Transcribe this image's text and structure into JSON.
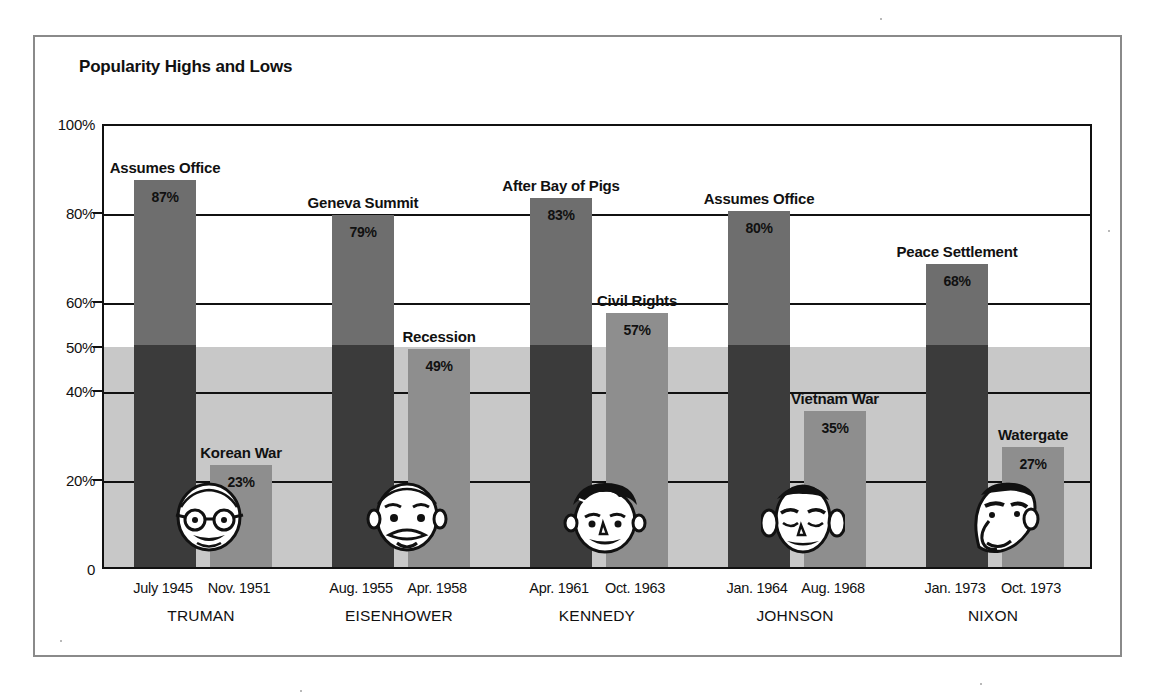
{
  "chart_data": {
    "type": "bar",
    "title": "Popularity Highs and Lows",
    "xlabel": "",
    "ylabel": "",
    "ylim": [
      0,
      100
    ],
    "yticks": [
      "0",
      "20%",
      "40%",
      "50%",
      "60%",
      "80%",
      "100%"
    ],
    "ytick_values": [
      0,
      20,
      40,
      50,
      60,
      80,
      100
    ],
    "gridlines": [
      20,
      40,
      60,
      80
    ],
    "grid": true,
    "legend": "none",
    "shaded_band": {
      "from": 0,
      "to": 50,
      "color": "#c8c8c8"
    },
    "groups": [
      {
        "president": "TRUMAN",
        "bars": [
          {
            "event": "Assumes Office",
            "value": 87,
            "value_label": "87%",
            "date": "July 1945",
            "kind": "high"
          },
          {
            "event": "Korean War",
            "value": 23,
            "value_label": "23%",
            "date": "Nov. 1951",
            "kind": "low"
          }
        ]
      },
      {
        "president": "EISENHOWER",
        "bars": [
          {
            "event": "Geneva Summit",
            "value": 79,
            "value_label": "79%",
            "date": "Aug. 1955",
            "kind": "high"
          },
          {
            "event": "Recession",
            "value": 49,
            "value_label": "49%",
            "date": "Apr. 1958",
            "kind": "low"
          }
        ]
      },
      {
        "president": "KENNEDY",
        "bars": [
          {
            "event": "After Bay of Pigs",
            "value": 83,
            "value_label": "83%",
            "date": "Apr. 1961",
            "kind": "high"
          },
          {
            "event": "Civil Rights",
            "value": 57,
            "value_label": "57%",
            "date": "Oct. 1963",
            "kind": "low"
          }
        ]
      },
      {
        "president": "JOHNSON",
        "bars": [
          {
            "event": "Assumes Office",
            "value": 80,
            "value_label": "80%",
            "date": "Jan. 1964",
            "kind": "high"
          },
          {
            "event": "Vietnam War",
            "value": 35,
            "value_label": "35%",
            "date": "Aug. 1968",
            "kind": "low"
          }
        ]
      },
      {
        "president": "NIXON",
        "bars": [
          {
            "event": "Peace Settlement",
            "value": 68,
            "value_label": "68%",
            "date": "Jan. 1973",
            "kind": "high"
          },
          {
            "event": "Watergate",
            "value": 27,
            "value_label": "27%",
            "date": "Oct. 1973",
            "kind": "low"
          }
        ]
      }
    ],
    "colors": {
      "high_bar_above_band": "#6e6e6e",
      "high_bar_in_band": "#3b3b3b",
      "low_bar": "#8e8e8e",
      "band": "#c8c8c8",
      "axis": "#111111",
      "frame": "#8a8a8a",
      "background": "#ffffff"
    }
  },
  "figure": {
    "title": "Popularity Highs and Lows"
  }
}
